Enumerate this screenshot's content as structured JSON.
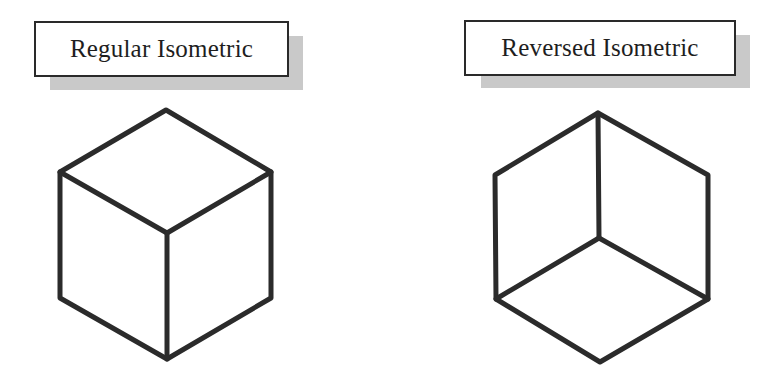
{
  "labels": {
    "regular": "Regular Isometric",
    "reversed": "Reversed Isometric"
  },
  "colors": {
    "stroke": "#2b2b2b",
    "shadow": "#c9c9c9",
    "background": "#ffffff"
  },
  "cubes": {
    "regular": {
      "view": "top faces visible (viewed from above)",
      "vertices": {
        "top": [
          166,
          110
        ],
        "upper_left": [
          60,
          172
        ],
        "upper_right": [
          271,
          172
        ],
        "center": [
          167,
          233
        ],
        "lower_left": [
          60,
          298
        ],
        "lower_right": [
          271,
          298
        ],
        "bottom": [
          167,
          359
        ]
      }
    },
    "reversed": {
      "view": "bottom face visible (viewed from below)",
      "vertices": {
        "top": [
          598,
          113
        ],
        "upper_left": [
          495,
          175
        ],
        "upper_right": [
          708,
          175
        ],
        "center": [
          599,
          238
        ],
        "lower_left": [
          496,
          299
        ],
        "lower_right": [
          708,
          299
        ],
        "bottom": [
          600,
          362
        ]
      }
    }
  }
}
